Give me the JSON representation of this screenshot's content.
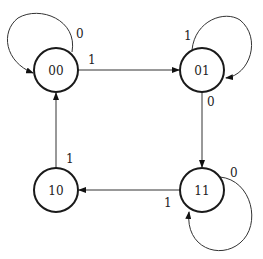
{
  "diagram": {
    "type": "state-transition-diagram",
    "states": [
      {
        "id": "00",
        "label": "00"
      },
      {
        "id": "01",
        "label": "01"
      },
      {
        "id": "10",
        "label": "10"
      },
      {
        "id": "11",
        "label": "11"
      }
    ],
    "transitions": [
      {
        "from": "00",
        "to": "00",
        "input": "0"
      },
      {
        "from": "00",
        "to": "01",
        "input": "1"
      },
      {
        "from": "01",
        "to": "01",
        "input": "1"
      },
      {
        "from": "01",
        "to": "11",
        "input": "0"
      },
      {
        "from": "11",
        "to": "11",
        "input": "0"
      },
      {
        "from": "11",
        "to": "10",
        "input": "1"
      },
      {
        "from": "10",
        "to": "00",
        "input": "1"
      }
    ]
  }
}
